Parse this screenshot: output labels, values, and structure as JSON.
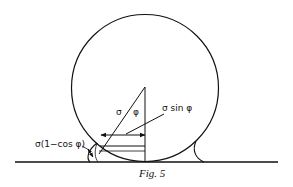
{
  "diagram": {
    "labels": {
      "radius": "σ",
      "angle": "φ",
      "horizontal_offset": "σ sin φ",
      "vertical_gap": "σ(1−cos φ)"
    },
    "caption": "Fig. 5",
    "colors": {
      "stroke": "#111111",
      "background": "#ffffff"
    }
  }
}
